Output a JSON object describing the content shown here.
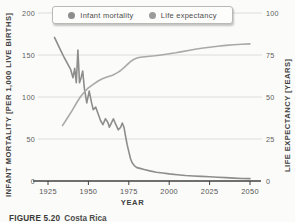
{
  "figure": {
    "caption_tag": "FIGURE 5.20",
    "caption_text": "Costa Rica"
  },
  "legend": {
    "items": [
      {
        "label": "Infant mortality",
        "color": "#8d8d8d"
      },
      {
        "label": "Life expectancy",
        "color": "#9b9b9b"
      }
    ]
  },
  "chart_data": {
    "type": "line",
    "title": "",
    "xlabel": "YEAR",
    "ylabel_left": "INFANT MORTALITY [PER 1,000 LIVE BIRTHS]",
    "ylabel_right": "LIFE EXPECTANCY [YEARS]",
    "xlim": [
      1925,
      2050
    ],
    "x_ticks": [
      1925,
      1950,
      1975,
      2000,
      2025,
      2050
    ],
    "ylim_left": [
      0,
      200
    ],
    "y_ticks_left": [
      0,
      50,
      100,
      150,
      200
    ],
    "ylim_right": [
      0,
      100
    ],
    "y_ticks_right": [
      0,
      25,
      50,
      75,
      100
    ],
    "grid": true,
    "legend_position": "top",
    "grid_color": "#dcdcda",
    "axis_color": "#414141",
    "series": [
      {
        "name": "Infant mortality",
        "axis": "left",
        "color": "#8d8d8d",
        "points": [
          [
            1929,
            171
          ],
          [
            1931,
            163
          ],
          [
            1933,
            155
          ],
          [
            1935,
            147
          ],
          [
            1937,
            140
          ],
          [
            1939,
            133
          ],
          [
            1940.5,
            123
          ],
          [
            1941.5,
            134
          ],
          [
            1942.5,
            117
          ],
          [
            1943.5,
            156
          ],
          [
            1944.5,
            117
          ],
          [
            1945.5,
            123
          ],
          [
            1946.5,
            131
          ],
          [
            1947.5,
            110
          ],
          [
            1949,
            93
          ],
          [
            1950.5,
            107
          ],
          [
            1952,
            93
          ],
          [
            1953,
            85
          ],
          [
            1954.5,
            88
          ],
          [
            1956,
            80
          ],
          [
            1957.5,
            72
          ],
          [
            1959,
            67
          ],
          [
            1960.5,
            74
          ],
          [
            1962,
            70
          ],
          [
            1963,
            64
          ],
          [
            1964.5,
            70
          ],
          [
            1965.5,
            74
          ],
          [
            1967,
            67
          ],
          [
            1968.5,
            61
          ],
          [
            1970,
            64
          ],
          [
            1971,
            69
          ],
          [
            1972,
            64
          ],
          [
            1973,
            53
          ],
          [
            1974,
            43
          ],
          [
            1975,
            35
          ],
          [
            1976,
            27
          ],
          [
            1977,
            22
          ],
          [
            1978.5,
            18
          ],
          [
            1980,
            16
          ],
          [
            1982,
            15
          ],
          [
            1985,
            13.5
          ],
          [
            1988,
            12
          ],
          [
            1992,
            10.5
          ],
          [
            1996,
            9.5
          ],
          [
            2000,
            8.5
          ],
          [
            2005,
            7.5
          ],
          [
            2010,
            6.5
          ],
          [
            2015,
            6
          ],
          [
            2020,
            5.5
          ],
          [
            2025,
            5
          ],
          [
            2030,
            4.5
          ],
          [
            2035,
            4
          ],
          [
            2040,
            3.5
          ],
          [
            2045,
            3
          ],
          [
            2050,
            2.8
          ]
        ]
      },
      {
        "name": "Life expectancy",
        "axis": "right",
        "color": "#a9a9a7",
        "points": [
          [
            1934,
            33
          ],
          [
            1937,
            37.5
          ],
          [
            1940,
            42
          ],
          [
            1943,
            47
          ],
          [
            1945,
            50
          ],
          [
            1948,
            53.5
          ],
          [
            1950,
            55.5
          ],
          [
            1953,
            57.5
          ],
          [
            1956,
            59.5
          ],
          [
            1959,
            61
          ],
          [
            1962,
            62
          ],
          [
            1965,
            63
          ],
          [
            1968,
            64.5
          ],
          [
            1970,
            65.8
          ],
          [
            1972,
            67.5
          ],
          [
            1974,
            69.3
          ],
          [
            1976,
            71
          ],
          [
            1978,
            72.3
          ],
          [
            1980,
            73.2
          ],
          [
            1982,
            73.7
          ],
          [
            1985,
            74
          ],
          [
            1988,
            74.3
          ],
          [
            1991,
            74.5
          ],
          [
            1994,
            74.9
          ],
          [
            1997,
            75.3
          ],
          [
            2000,
            75.7
          ],
          [
            2004,
            76.3
          ],
          [
            2008,
            77
          ],
          [
            2012,
            77.7
          ],
          [
            2016,
            78.4
          ],
          [
            2020,
            79
          ],
          [
            2025,
            79.6
          ],
          [
            2030,
            80.2
          ],
          [
            2035,
            80.7
          ],
          [
            2040,
            81.1
          ],
          [
            2045,
            81.4
          ],
          [
            2050,
            81.6
          ]
        ]
      }
    ]
  }
}
